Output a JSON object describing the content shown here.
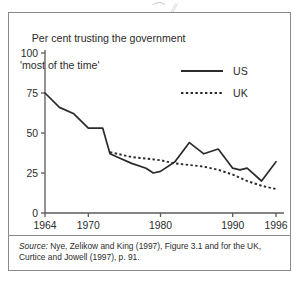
{
  "figure": {
    "title_line1": "Per cent trusting the government",
    "title_line2": "'most of the time'",
    "scan_marks": "⌒ ⫽",
    "source_label": "Source:",
    "source_text": "  Nye, Zelikow and King (1997), Figure 3.1 and for the UK, Curtice and Jowell (1997), p. 91.",
    "frame_color": "#8a8a8a",
    "line_color": "#2b2b2b"
  },
  "chart_data": {
    "type": "line",
    "title": "Per cent trusting the government 'most of the time'",
    "xlabel": "",
    "ylabel": "",
    "xlim": [
      1964,
      1996
    ],
    "ylim": [
      0,
      100
    ],
    "grid": false,
    "legend_position": "top-right",
    "xticks": [
      1964,
      1970,
      1980,
      1990,
      1996
    ],
    "xtick_labels": [
      "1964",
      "1970",
      "1980",
      "1990",
      "1996"
    ],
    "yticks": [
      0,
      25,
      50,
      75,
      100
    ],
    "ytick_labels": [
      "0",
      "25",
      "50",
      "75",
      "100"
    ],
    "series": [
      {
        "name": "US",
        "style": "solid",
        "x": [
          1964,
          1966,
          1968,
          1970,
          1972,
          1973,
          1974,
          1976,
          1978,
          1979,
          1980,
          1982,
          1984,
          1986,
          1988,
          1990,
          1991,
          1992,
          1994,
          1996
        ],
        "values": [
          75,
          66,
          62,
          53,
          53,
          37,
          35,
          31,
          28,
          25,
          26,
          32,
          44,
          37,
          40,
          28,
          27,
          28,
          20,
          32
        ]
      },
      {
        "name": "UK",
        "style": "dotted",
        "x": [
          1973,
          1974,
          1976,
          1978,
          1980,
          1982,
          1984,
          1986,
          1988,
          1990,
          1992,
          1994,
          1996
        ],
        "values": [
          38,
          37,
          35,
          34,
          33,
          31,
          30,
          29,
          27,
          24,
          20,
          17,
          15
        ]
      }
    ]
  },
  "legend": {
    "items": [
      {
        "label": "US",
        "style": "solid"
      },
      {
        "label": "UK",
        "style": "dotted"
      }
    ]
  }
}
